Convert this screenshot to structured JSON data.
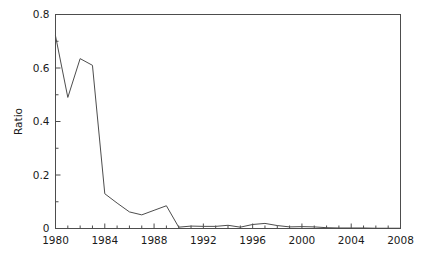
{
  "chart_data": {
    "type": "line",
    "title": "",
    "subtitle": "",
    "xlabel": "",
    "ylabel": "Ratio",
    "xlim": [
      1980,
      2008
    ],
    "ylim": [
      0,
      0.8
    ],
    "grid": false,
    "legend": null,
    "legend_position": "none",
    "line_color": "#4d4d4d",
    "axis_color": "#4d4d4d",
    "background_color": "#ffffff",
    "x_major_ticks": [
      1980,
      1984,
      1988,
      1992,
      1996,
      2000,
      2004,
      2008
    ],
    "x_major_tick_labels": [
      "1980",
      "1984",
      "1988",
      "1992",
      "1996",
      "2000",
      "2004",
      "2008"
    ],
    "x_minor_tick_interval": 1,
    "y_major_ticks": [
      0,
      0.2,
      0.4,
      0.6,
      0.8
    ],
    "y_major_tick_labels": [
      "0",
      "0.2",
      "0.4",
      "0.6",
      "0.8"
    ],
    "y_minor_tick_interval": 0.1,
    "x": [
      1980,
      1981,
      1982,
      1983,
      1984,
      1985,
      1986,
      1987,
      1988,
      1989,
      1990,
      1991,
      1992,
      1993,
      1994,
      1995,
      1996,
      1997,
      1998,
      1999,
      2000,
      2001,
      2002,
      2003,
      2004,
      2005,
      2006,
      2007,
      2008
    ],
    "values": [
      0.72,
      0.49,
      0.635,
      0.61,
      0.13,
      0.095,
      0.062,
      0.051,
      0.068,
      0.085,
      0.005,
      0.009,
      0.008,
      0.008,
      0.012,
      0.005,
      0.015,
      0.019,
      0.011,
      0.006,
      0.007,
      0.006,
      0.003,
      0.002,
      0.002,
      0.002,
      0.001,
      0.001,
      0.001
    ],
    "series": [
      {
        "name": "Ratio",
        "values": [
          0.72,
          0.49,
          0.635,
          0.61,
          0.13,
          0.095,
          0.062,
          0.051,
          0.068,
          0.085,
          0.005,
          0.009,
          0.008,
          0.008,
          0.012,
          0.005,
          0.015,
          0.019,
          0.011,
          0.006,
          0.007,
          0.006,
          0.003,
          0.002,
          0.002,
          0.002,
          0.001,
          0.001,
          0.001
        ]
      }
    ]
  }
}
